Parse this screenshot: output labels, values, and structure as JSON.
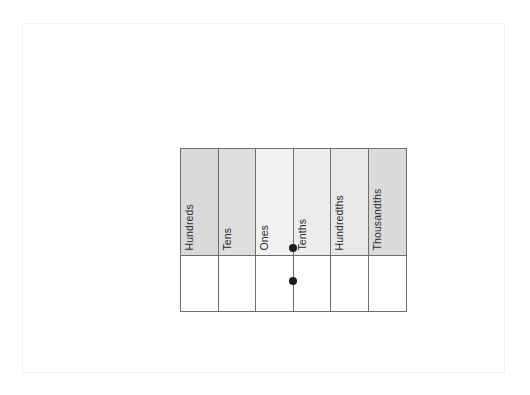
{
  "diagram": {
    "type": "place-value-chart",
    "columns": [
      {
        "label": "Hundreds",
        "shade": "#d9d9d9",
        "side": "whole"
      },
      {
        "label": "Tens",
        "shade": "#dedede",
        "side": "whole"
      },
      {
        "label": "Ones",
        "shade": "#f2f2f2",
        "side": "whole"
      },
      {
        "label": "Tenths",
        "shade": "#ededed",
        "side": "decimal"
      },
      {
        "label": "Hundredths",
        "shade": "#e8e8e8",
        "side": "decimal"
      },
      {
        "label": "Thousandths",
        "shade": "#dbdbdb",
        "side": "decimal"
      }
    ],
    "value_row": [
      "",
      "",
      "",
      "",
      "",
      ""
    ],
    "decimal_point_markers": [
      {
        "name": "decimal-point-top",
        "between": "Ones|Tenths",
        "row": "header"
      },
      {
        "name": "decimal-point-bottom",
        "between": "Ones|Tenths",
        "row": "value"
      }
    ],
    "colors": {
      "border": "#6e6e6e",
      "text": "#2b2b2b",
      "dot": "#1c1c1c",
      "page_border": "#f0f0f0",
      "value_row_fill": "#ffffff"
    }
  }
}
